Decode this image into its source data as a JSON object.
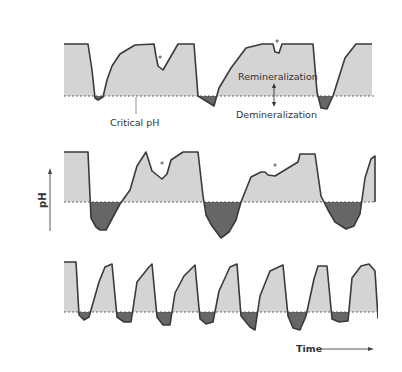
{
  "figure": {
    "colors": {
      "remin_fill": "#d4d4d4",
      "demin_fill": "#666666",
      "curve": "#3a3a3a",
      "critical_line": "#444444",
      "text": "#333333"
    },
    "labels": {
      "critical_ph": "Critical pH",
      "remineralization": "Remineralization",
      "demineralization": "Demineralization",
      "y_axis": "pH",
      "x_axis": "Time",
      "asterisk": "*"
    }
  },
  "chart_data": {
    "type": "area",
    "title": "",
    "xlabel": "Time",
    "ylabel": "pH",
    "panels": [
      {
        "name": "panel-1",
        "baseline_y": 96,
        "description": "Few acid attacks; mostly remineralization",
        "points": [
          [
            64,
            44
          ],
          [
            88,
            44
          ],
          [
            92,
            70
          ],
          [
            95,
            98
          ],
          [
            98,
            100
          ],
          [
            103,
            97
          ],
          [
            107,
            80
          ],
          [
            112,
            66
          ],
          [
            120,
            54
          ],
          [
            135,
            45
          ],
          [
            154,
            44
          ],
          [
            156,
            56
          ],
          [
            158,
            66
          ],
          [
            163,
            70
          ],
          [
            178,
            44
          ],
          [
            194,
            44
          ],
          [
            198,
            96
          ],
          [
            214,
            106
          ],
          [
            219,
            88
          ],
          [
            231,
            68
          ],
          [
            246,
            48
          ],
          [
            262,
            44
          ],
          [
            273,
            44
          ],
          [
            275,
            52
          ],
          [
            279,
            53
          ],
          [
            282,
            44
          ],
          [
            313,
            44
          ],
          [
            317,
            92
          ],
          [
            321,
            108
          ],
          [
            327,
            109
          ],
          [
            333,
            96
          ],
          [
            345,
            58
          ],
          [
            356,
            44
          ],
          [
            372,
            44
          ]
        ],
        "asterisks": [
          [
            158,
            62
          ],
          [
            275,
            46
          ]
        ]
      },
      {
        "name": "panel-2",
        "baseline_y": 202,
        "description": "Frequent prolonged demineralization",
        "points": [
          [
            64,
            152
          ],
          [
            88,
            152
          ],
          [
            91,
            218
          ],
          [
            96,
            227
          ],
          [
            100,
            230
          ],
          [
            106,
            230
          ],
          [
            120,
            204
          ],
          [
            130,
            190
          ],
          [
            137,
            166
          ],
          [
            146,
            152
          ],
          [
            152,
            171
          ],
          [
            162,
            179
          ],
          [
            167,
            174
          ],
          [
            171,
            160
          ],
          [
            183,
            152
          ],
          [
            198,
            152
          ],
          [
            203,
            196
          ],
          [
            206,
            215
          ],
          [
            212,
            226
          ],
          [
            221,
            238
          ],
          [
            229,
            232
          ],
          [
            236,
            220
          ],
          [
            241,
            202
          ],
          [
            251,
            177
          ],
          [
            261,
            172
          ],
          [
            265,
            172
          ],
          [
            268,
            175
          ],
          [
            275,
            176
          ],
          [
            298,
            162
          ],
          [
            300,
            154
          ],
          [
            315,
            154
          ],
          [
            321,
            196
          ],
          [
            328,
            210
          ],
          [
            335,
            222
          ],
          [
            346,
            229
          ],
          [
            354,
            226
          ],
          [
            360,
            214
          ],
          [
            365,
            178
          ],
          [
            371,
            159
          ],
          [
            375,
            156
          ],
          [
            375,
            202
          ]
        ],
        "asterisks": [
          [
            160,
            168
          ],
          [
            273,
            170
          ]
        ]
      },
      {
        "name": "panel-3",
        "baseline_y": 312,
        "description": "Very frequent short acid attacks",
        "points": [
          [
            64,
            262
          ],
          [
            76,
            262
          ],
          [
            79,
            315
          ],
          [
            84,
            320
          ],
          [
            89,
            317
          ],
          [
            93,
            303
          ],
          [
            99,
            282
          ],
          [
            105,
            267
          ],
          [
            112,
            264
          ],
          [
            117,
            317
          ],
          [
            124,
            322
          ],
          [
            131,
            322
          ],
          [
            137,
            282
          ],
          [
            149,
            267
          ],
          [
            152,
            264
          ],
          [
            157,
            317
          ],
          [
            163,
            325
          ],
          [
            170,
            325
          ],
          [
            175,
            293
          ],
          [
            184,
            276
          ],
          [
            195,
            265
          ],
          [
            200,
            319
          ],
          [
            206,
            324
          ],
          [
            213,
            322
          ],
          [
            219,
            291
          ],
          [
            230,
            267
          ],
          [
            237,
            264
          ],
          [
            241,
            316
          ],
          [
            250,
            327
          ],
          [
            255,
            330
          ],
          [
            260,
            296
          ],
          [
            270,
            271
          ],
          [
            283,
            265
          ],
          [
            288,
            316
          ],
          [
            293,
            328
          ],
          [
            300,
            330
          ],
          [
            306,
            316
          ],
          [
            314,
            279
          ],
          [
            318,
            266
          ],
          [
            327,
            266
          ],
          [
            332,
            319
          ],
          [
            339,
            322
          ],
          [
            348,
            321
          ],
          [
            352,
            278
          ],
          [
            361,
            266
          ],
          [
            369,
            264
          ],
          [
            375,
            271
          ],
          [
            378,
            318
          ],
          [
            385,
            322
          ],
          [
            392,
            322
          ],
          [
            393,
            288
          ],
          [
            402,
            267
          ]
        ],
        "asterisks": []
      }
    ]
  }
}
